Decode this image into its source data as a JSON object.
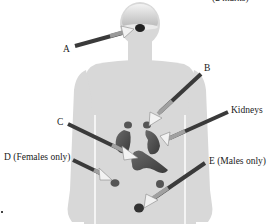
{
  "diagram": {
    "marks_text": "(2 marks)",
    "labels": {
      "a": "A",
      "b": "B",
      "c": "C",
      "kidneys": "Kidneys",
      "d": "D (Females only)",
      "e": "E (Males only)"
    },
    "colors": {
      "body": "#d8d8d8",
      "body_highlight": "#eeeeee",
      "organ": "#5a5a5a",
      "organ_dark": "#333333",
      "arrow_dark": "#3a3a3a",
      "arrow_light": "#f2f2f2",
      "text": "#1a1a1a"
    }
  }
}
